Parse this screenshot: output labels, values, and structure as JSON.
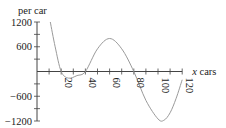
{
  "chart_data": {
    "type": "line",
    "title": "",
    "ylabel": "per car",
    "xlabel": "x cars",
    "xlabel_var": "x",
    "xlabel_unit": "cars",
    "xlim": [
      0,
      120
    ],
    "ylim": [
      -1200,
      1200
    ],
    "x_ticks": [
      20,
      40,
      60,
      80,
      100,
      120
    ],
    "x_tick_labels": [
      "20",
      "40",
      "60",
      "80",
      "100",
      "120"
    ],
    "y_ticks_labeled": [
      1200,
      600,
      -600,
      -1200
    ],
    "y_tick_labels": [
      "1200",
      "600",
      "−600",
      "−1200"
    ],
    "y_minor_tick_step": 300,
    "x_minor_tick_step": 10,
    "grid": false,
    "legend": null,
    "series": [
      {
        "name": "curve",
        "x": [
          11,
          15,
          20,
          26,
          33,
          40,
          50,
          60,
          70,
          80,
          90,
          100,
          105,
          110,
          115,
          120
        ],
        "y": [
          1200,
          600,
          0,
          -160,
          -100,
          0,
          550,
          800,
          550,
          0,
          -700,
          -1150,
          -1180,
          -1000,
          -650,
          -200
        ]
      }
    ]
  }
}
